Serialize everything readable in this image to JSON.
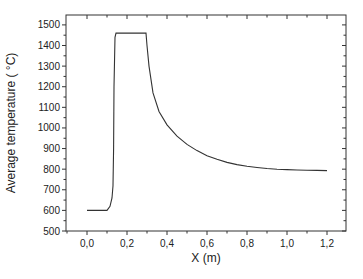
{
  "chart_data": {
    "type": "line",
    "title": "",
    "xlabel": "X (m)",
    "ylabel": "Average temperature ( °C)",
    "xlim": [
      -0.105,
      1.295
    ],
    "ylim": [
      500,
      1548
    ],
    "grid": false,
    "legend": null,
    "x_ticks": [
      0.0,
      0.2,
      0.4,
      0.6,
      0.8,
      1.0,
      1.2
    ],
    "x_tick_labels": [
      "0,0",
      "0,2",
      "0,4",
      "0,6",
      "0,8",
      "1,0",
      "1,2"
    ],
    "y_ticks": [
      500,
      600,
      700,
      800,
      900,
      1000,
      1100,
      1200,
      1300,
      1400,
      1500
    ],
    "y_tick_labels": [
      "500",
      "600",
      "700",
      "800",
      "900",
      "1000",
      "1100",
      "1200",
      "1300",
      "1400",
      "1500"
    ],
    "series": [
      {
        "name": "Average temperature",
        "color": "#333333",
        "x": [
          0.0,
          0.05,
          0.1,
          0.115,
          0.125,
          0.13,
          0.133,
          0.135,
          0.14,
          0.145,
          0.2,
          0.25,
          0.295,
          0.3,
          0.31,
          0.33,
          0.36,
          0.4,
          0.45,
          0.5,
          0.55,
          0.6,
          0.65,
          0.7,
          0.75,
          0.8,
          0.85,
          0.9,
          0.95,
          1.0,
          1.05,
          1.1,
          1.15,
          1.2
        ],
        "y": [
          600,
          600,
          600,
          620,
          660,
          720,
          900,
          1200,
          1440,
          1460,
          1460,
          1460,
          1460,
          1400,
          1300,
          1170,
          1080,
          1015,
          960,
          920,
          890,
          865,
          848,
          833,
          822,
          814,
          808,
          803,
          800,
          798,
          796,
          795,
          794,
          793
        ]
      }
    ]
  }
}
